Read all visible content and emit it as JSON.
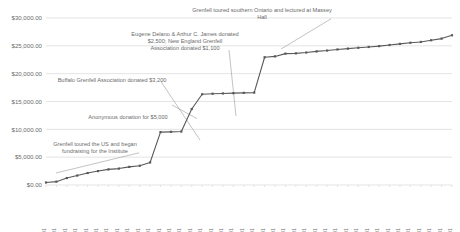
{
  "chart_data": {
    "type": "line",
    "title": "",
    "subtitle": "",
    "xlabel": "",
    "ylabel": "",
    "grid": true,
    "legend": false,
    "ylim": [
      0,
      30000
    ],
    "ytick_labels": [
      "$0.00",
      "$5,000.00",
      "$10,000.00",
      "$15,000.00",
      "$20,000.00",
      "$25,000.00",
      "$30,000.00"
    ],
    "ytick_values": [
      0,
      5000,
      10000,
      15000,
      20000,
      25000,
      30000
    ],
    "categories": [
      "1905-07-01",
      "1905-09-01",
      "1905-11-01",
      "1906-01-01",
      "1906-03-01",
      "1906-05-01",
      "1906-07-01",
      "1906-09-01",
      "1906-11-01",
      "1907-01-01",
      "1907-03-01",
      "1907-05-01",
      "1907-07-01",
      "1907-09-01",
      "1907-11-01",
      "1908-01-01",
      "1908-03-01",
      "1908-05-01",
      "1908-07-01",
      "1908-09-01",
      "1908-11-01",
      "1909-01-01",
      "1909-03-01",
      "1909-05-01",
      "1909-07-01",
      "1909-09-01",
      "1909-11-01",
      "1910-01-01",
      "1910-03-01",
      "1910-05-01",
      "1910-07-01",
      "1910-09-01",
      "1910-11-01",
      "1911-01-01",
      "1911-03-01",
      "1911-05-01",
      "1911-07-01",
      "1911-09-01",
      "1911-11-01",
      "1912-01-01"
    ],
    "series": [
      {
        "name": "Cumulative donations",
        "color": "#595959",
        "values": [
          450,
          600,
          1250,
          1700,
          2150,
          2500,
          2800,
          2950,
          3250,
          3450,
          4050,
          9500,
          9550,
          9600,
          13650,
          16300,
          16400,
          16450,
          16500,
          16550,
          16600,
          22950,
          23100,
          23600,
          23650,
          23800,
          24000,
          24150,
          24350,
          24500,
          24650,
          24800,
          24950,
          25150,
          25350,
          25550,
          25700,
          26000,
          26300,
          26900
        ]
      }
    ],
    "annotations": [
      {
        "id": "annot-grenfell-us-tour",
        "text": "Grenfell toured the US and began fundraising for the Institute",
        "target_category": "1905-09-01"
      },
      {
        "id": "annot-anonymous-donation",
        "text": "Anonymous donation for $5,000",
        "target_category": "1907-05-01"
      },
      {
        "id": "annot-buffalo-association",
        "text": "Buffalo Grenfell Association donated $3,200",
        "target_category": "1907-11-01"
      },
      {
        "id": "annot-delano-james",
        "text": "Eugene Delano & Arthur C. James donated $2,500; New England Grenfell Association donated $1,100",
        "target_category": "1908-01-01"
      },
      {
        "id": "annot-ontario-massey-hall",
        "text": "Grenfell toured southern Ontario and lectured at Massey Hall",
        "target_category": "1909-01-01"
      }
    ]
  }
}
